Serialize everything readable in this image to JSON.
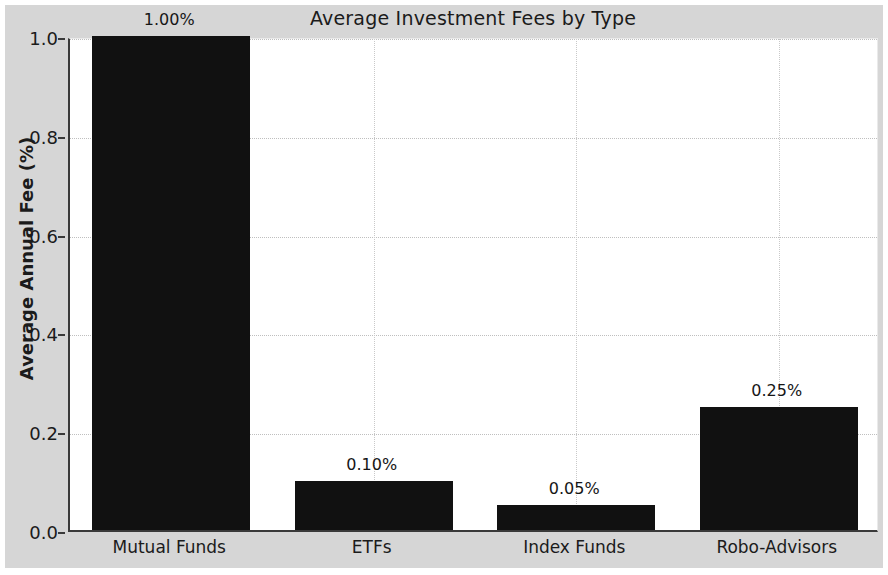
{
  "chart_data": {
    "type": "bar",
    "title": "Average Investment Fees by Type",
    "xlabel": "",
    "ylabel": "Average Annual Fee (%)",
    "categories": [
      "Mutual Funds",
      "ETFs",
      "Index Funds",
      "Robo-Advisors"
    ],
    "values": [
      1.0,
      0.1,
      0.05,
      0.25
    ],
    "data_labels": [
      "1.00%",
      "0.10%",
      "0.05%",
      "0.25%"
    ],
    "ylim": [
      0.0,
      1.0
    ],
    "ytick_values": [
      0.0,
      0.2,
      0.4,
      0.6,
      0.8,
      1.0
    ],
    "ytick_labels": [
      "0.0",
      "0.2",
      "0.4",
      "0.6",
      "0.8",
      "1.0"
    ],
    "grid": true,
    "grid_style": "dotted",
    "legend": null,
    "bar_color": "#111111",
    "figure_facecolor": "#d6d6d6",
    "axes_facecolor": "#ffffff"
  }
}
